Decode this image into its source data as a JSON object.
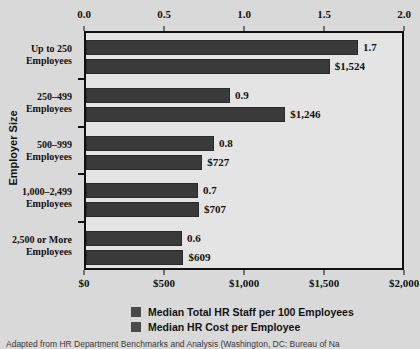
{
  "chart_data": {
    "type": "bar",
    "orientation": "horizontal",
    "title": "",
    "ylabel": "Employer Size",
    "xlabel": "",
    "grid": false,
    "legend_position": "bottom",
    "categories": [
      "Up to 250 Employees",
      "250–499 Employees",
      "500–999 Employees",
      "1,000–2,499 Employees",
      "2,500 or More Employees"
    ],
    "category_lines": [
      [
        "Up to 250",
        "Employees"
      ],
      [
        "250–499",
        "Employees"
      ],
      [
        "500–999",
        "Employees"
      ],
      [
        "1,000–2,499",
        "Employees"
      ],
      [
        "2,500 or More",
        "Employees"
      ]
    ],
    "series": [
      {
        "name": "Median Total HR Staff per 100 Employees",
        "axis": "top",
        "values": [
          1.7,
          0.9,
          0.8,
          0.7,
          0.6
        ],
        "labels": [
          "1.7",
          "0.9",
          "0.8",
          "0.7",
          "0.6"
        ],
        "color": "#3a3a3a"
      },
      {
        "name": "Median HR Cost per Employee",
        "axis": "bottom",
        "values": [
          1524,
          1246,
          727,
          707,
          609
        ],
        "labels": [
          "$1,524",
          "$1,246",
          "$727",
          "$707",
          "$609"
        ],
        "color": "#3a3a3a"
      }
    ],
    "top_axis": {
      "label": "",
      "range": [
        0.0,
        2.0
      ],
      "ticks": [
        0.0,
        0.5,
        1.0,
        1.5,
        2.0
      ],
      "tick_labels": [
        "0.0",
        "0.5",
        "1.0",
        "1.5",
        "2.0"
      ]
    },
    "bottom_axis": {
      "label": "",
      "range": [
        0,
        2000
      ],
      "ticks": [
        0,
        500,
        1000,
        1500,
        2000
      ],
      "tick_labels": [
        "$0",
        "$500",
        "$1,000",
        "$1,500",
        "$2,000"
      ]
    },
    "colors": {
      "bar": "#3a3a3a",
      "plot_background": "#e4e4e4",
      "page_background": "#d9d9d9",
      "axis": "#111111"
    }
  },
  "legend": {
    "items": [
      {
        "label": "Median Total HR Staff per 100 Employees",
        "color": "#4a4a4a"
      },
      {
        "label": "Median HR Cost per Employee",
        "color": "#4a4a4a"
      }
    ]
  },
  "y_axis_title": "Employer Size",
  "source_note": "Adapted from  HR Department Benchmarks and Analysis (Washington, DC: Bureau of Na"
}
